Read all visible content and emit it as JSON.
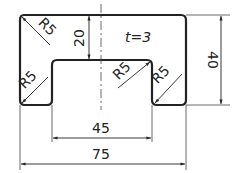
{
  "drawing": {
    "title": "U-channel profile cross-section",
    "thickness_label": "t=3",
    "dimensions": {
      "overall_width": "75",
      "inner_width": "45",
      "overall_height": "40",
      "depth": "20"
    },
    "radii": [
      "R5",
      "R5",
      "R5",
      "R5"
    ],
    "colors": {
      "line": "#222222",
      "background": "#ffffff"
    }
  }
}
